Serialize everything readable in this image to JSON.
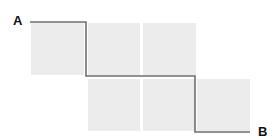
{
  "diagram": {
    "start_label": "A",
    "end_label": "B",
    "colors": {
      "square_fill": "#ececec",
      "path_stroke": "#6e6e6e",
      "label": "#111111",
      "background": "#ffffff"
    },
    "squares": [
      {
        "row": 0,
        "col": 0,
        "x": 31,
        "y": 23,
        "w": 53,
        "h": 52
      },
      {
        "row": 0,
        "col": 1,
        "x": 88,
        "y": 23,
        "w": 52,
        "h": 52
      },
      {
        "row": 0,
        "col": 2,
        "x": 143,
        "y": 23,
        "w": 53,
        "h": 52
      },
      {
        "row": 1,
        "col": 1,
        "x": 88,
        "y": 79,
        "w": 52,
        "h": 52
      },
      {
        "row": 1,
        "col": 2,
        "x": 143,
        "y": 79,
        "w": 52,
        "h": 52
      },
      {
        "row": 1,
        "col": 3,
        "x": 197,
        "y": 79,
        "w": 53,
        "h": 52
      }
    ],
    "path_points": [
      [
        30,
        22
      ],
      [
        86,
        22
      ],
      [
        86,
        76
      ],
      [
        195,
        76
      ],
      [
        195,
        132
      ],
      [
        250,
        132
      ]
    ]
  }
}
